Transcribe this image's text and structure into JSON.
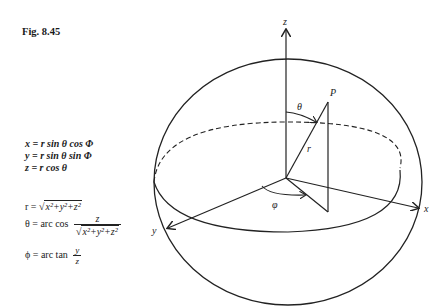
{
  "figure": {
    "label": "Fig. 8.45"
  },
  "cartesian_equations": [
    {
      "lhs": "x",
      "rhs": "= r sin θ cos Φ"
    },
    {
      "lhs": "y",
      "rhs": "= r sin θ sin Φ"
    },
    {
      "lhs": "z",
      "rhs": "= r cos θ"
    }
  ],
  "inverse_equations": {
    "r": {
      "lhs": "r =",
      "radical": "x²+y²+z²"
    },
    "theta": {
      "lhs": "θ = arc cos",
      "numerator": "z",
      "denominator_radical": "x²+y²+z²"
    },
    "phi": {
      "lhs": "ϕ = arc tan",
      "numerator": "y",
      "denominator": "z"
    }
  },
  "diagram": {
    "axis_labels": {
      "z": "z",
      "x": "x",
      "y": "y"
    },
    "point_label": "P",
    "radius_label": "r",
    "polar_angle_label": "θ",
    "azimuth_angle_label": "φ"
  }
}
